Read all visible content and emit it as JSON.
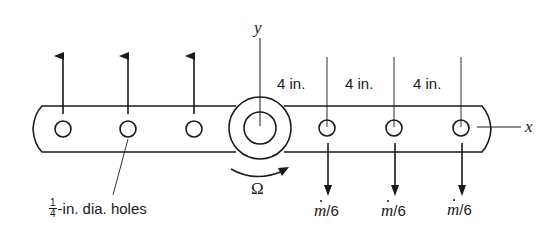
{
  "diagram": {
    "stroke_color": "#1a1a1a",
    "background": "#ffffff",
    "axes": {
      "y_label": "y",
      "x_label": "x"
    },
    "rotation": {
      "symbol": "Ω"
    },
    "spacing_labels": [
      "4 in.",
      "4 in.",
      "4 in."
    ],
    "flow_labels": [
      {
        "symbol": "m",
        "dot": true,
        "suffix": "/6"
      },
      {
        "symbol": "m",
        "dot": true,
        "suffix": "/6"
      },
      {
        "symbol": "m",
        "dot": true,
        "suffix": "/6"
      }
    ],
    "hole_note": {
      "fraction_numerator": "1",
      "fraction_denominator": "4",
      "text": "-in. dia. holes"
    },
    "holes": {
      "left_count": 3,
      "right_count": 3,
      "left_flow_direction": "up",
      "right_flow_direction": "down"
    }
  }
}
